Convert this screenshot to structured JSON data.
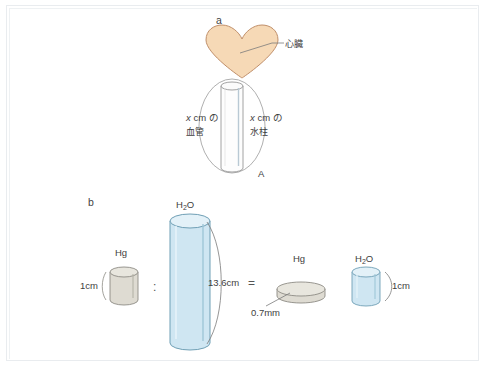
{
  "figure": {
    "panel_a": {
      "letter": "a",
      "heart_label": "心臓",
      "vessel_label_line1": "x cm の",
      "vessel_label_line2": "血管",
      "water_label_line1": "x cm の",
      "water_label_line2": "水柱",
      "point_label": "A",
      "heart_color": "#f6d9b6",
      "heart_stroke": "#c9a889"
    },
    "panel_b": {
      "letter": "b",
      "hg_label_left": "Hg",
      "hg_height_left": "1cm",
      "ratio_symbol": ":",
      "h2o_label_tall": "H₂O",
      "h2o_label_tall_base": "H",
      "h2o_label_tall_sub": "2",
      "h2o_label_tall_tail": "O",
      "h2o_height_tall": "13.6cm",
      "equals_symbol": "=",
      "hg_label_right": "Hg",
      "hg_thickness_right": "0.7mm",
      "h2o_label_right": "H₂O",
      "h2o_height_right": "1cm",
      "water_color": "#cfe6f2",
      "water_stroke": "#7fa9bd",
      "mercury_color": "#d9d6cd",
      "mercury_stroke": "#8d8b84"
    }
  },
  "icons": {
    "heart": "heart-shape-icon",
    "cylinder_tall": "tall-cylinder-icon",
    "cylinder_small": "small-cylinder-icon",
    "disk": "thin-disk-icon",
    "vessel": "blood-vessel-icon",
    "brace": "curly-brace-icon",
    "leader": "leader-line-icon"
  }
}
